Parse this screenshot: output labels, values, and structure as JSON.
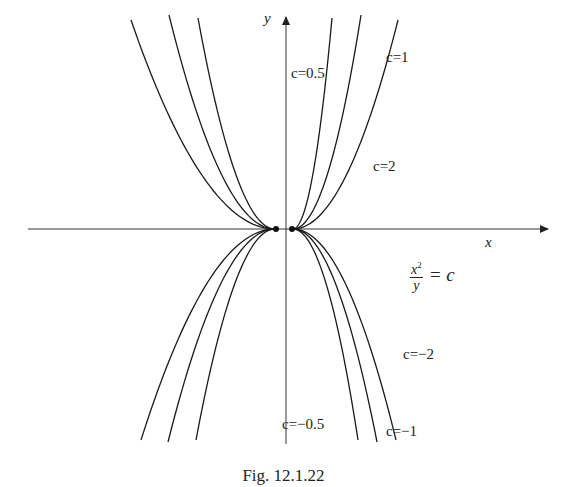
{
  "chart_data": {
    "type": "line",
    "title": "",
    "caption": "Fig.  12.1.22",
    "equation": {
      "numerator": "x",
      "exponent": "2",
      "denominator": "y",
      "rhs": "= c"
    },
    "xlabel": "x",
    "ylabel": "y",
    "grid": false,
    "legend": "none",
    "series": [
      {
        "name": "c=0.5",
        "family": "y = x^2 / c",
        "c": 0.5,
        "side": "upper"
      },
      {
        "name": "c=1",
        "family": "y = x^2 / c",
        "c": 1,
        "side": "upper"
      },
      {
        "name": "c=2",
        "family": "y = x^2 / c",
        "c": 2,
        "side": "upper"
      },
      {
        "name": "c=-0.5",
        "family": "y = x^2 / c",
        "c": -0.5,
        "side": "lower"
      },
      {
        "name": "c=-1",
        "family": "y = x^2 / c",
        "c": -1,
        "side": "lower"
      },
      {
        "name": "c=-2",
        "family": "y = x^2 / c",
        "c": -2,
        "side": "lower"
      }
    ],
    "annotations": [
      "c=0.5",
      "c=1",
      "c=2",
      "c=-2",
      "c=-0.5",
      "c=-1"
    ]
  },
  "labels": {
    "y_axis": "y",
    "x_axis": "x",
    "c_0_5": "c=0.5",
    "c_1": "c=1",
    "c_2": "c=2",
    "c_m2": "c=−2",
    "c_m0_5": "c=−0.5",
    "c_m1": "c=−1",
    "eq_num": "x",
    "eq_exp": "2",
    "eq_den": "y",
    "eq_rhs": "= c",
    "caption": "Fig.  12.1.22"
  },
  "geometry": {
    "origin": [
      286,
      229
    ],
    "vertex_left": 275,
    "vertex_right": 293,
    "upper_ends_right": [
      [
        332,
        18
      ],
      [
        361,
        15
      ],
      [
        398,
        20
      ]
    ],
    "upper_ends_left": [
      [
        198,
        18
      ],
      [
        169,
        15
      ],
      [
        131,
        20
      ]
    ],
    "lower_ends_right": [
      [
        358,
        440
      ],
      [
        377,
        442
      ],
      [
        396,
        440
      ]
    ],
    "lower_ends_left": [
      [
        196,
        440
      ],
      [
        168,
        442
      ],
      [
        141,
        440
      ]
    ]
  }
}
